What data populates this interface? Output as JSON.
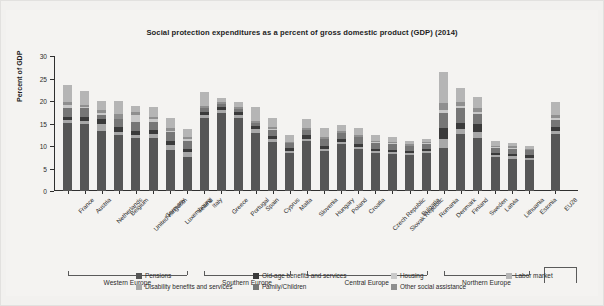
{
  "chart_data": {
    "type": "bar",
    "subtype": "stacked-bar",
    "title": "Social protection expenditures as a percent of gross domestic product (GDP) (2014)",
    "xlabel": "",
    "ylabel": "Percent of GDP",
    "ylim": [
      0,
      30
    ],
    "yticks": [
      0,
      5,
      10,
      15,
      20,
      25,
      30
    ],
    "grid": false,
    "legend_position": "bottom",
    "categories": [
      "France",
      "Austria",
      "Netherlands",
      "Belgium",
      "United Kingdom",
      "Germany",
      "Luxembourg",
      "Ireland",
      "Italy",
      "Greece",
      "Portugal",
      "Spain",
      "Cyprus",
      "Malta",
      "Slovenia",
      "Hungary",
      "Poland",
      "Croatia",
      "Czech Republic",
      "Slovak Republic",
      "Bulgaria",
      "Romania",
      "Denmark",
      "Finland",
      "Sweden",
      "Latvia",
      "Lithuania",
      "Estonia",
      "EU28"
    ],
    "series": [
      {
        "name": "Pensions",
        "color": "#565656",
        "values": [
          15.1,
          14.8,
          13.3,
          12.4,
          11.7,
          11.8,
          9.2,
          7.6,
          16.3,
          17.4,
          16.2,
          13.0,
          11.0,
          8.5,
          11.1,
          8.8,
          10.4,
          9.3,
          8.4,
          8.2,
          8.1,
          8.5,
          9.6,
          12.6,
          11.8,
          7.5,
          7.2,
          7.0,
          12.6
        ]
      },
      {
        "name": "Disability benefits and services",
        "color": "#a8a8a8",
        "values": [
          0.6,
          0.7,
          1.6,
          0.8,
          0.8,
          0.9,
          1.1,
          1.1,
          0.5,
          0.5,
          0.6,
          0.7,
          0.5,
          0.5,
          0.5,
          0.6,
          0.6,
          0.5,
          0.5,
          0.5,
          0.4,
          0.4,
          2.0,
          1.2,
          1.3,
          0.4,
          0.5,
          0.4,
          0.7
        ]
      },
      {
        "name": "Old-age benefits and services",
        "color": "#3a3a3a",
        "values": [
          0.8,
          1.0,
          1.2,
          1.0,
          0.9,
          0.9,
          0.9,
          0.6,
          0.8,
          0.8,
          0.7,
          0.7,
          0.7,
          0.6,
          0.8,
          0.6,
          0.5,
          0.6,
          0.5,
          0.5,
          0.4,
          0.4,
          2.3,
          1.4,
          1.9,
          0.5,
          0.5,
          0.5,
          0.9
        ]
      },
      {
        "name": "Family/Children",
        "color": "#767676",
        "values": [
          1.9,
          1.9,
          0.9,
          1.7,
          1.9,
          1.8,
          1.9,
          1.8,
          0.8,
          0.6,
          0.7,
          0.7,
          1.3,
          1.0,
          1.2,
          1.5,
          1.3,
          1.5,
          1.3,
          1.3,
          1.1,
          1.2,
          3.5,
          3.2,
          2.1,
          1.2,
          1.2,
          1.2,
          1.6
        ]
      },
      {
        "name": "Housing",
        "color": "#c9c9c9",
        "values": [
          0.8,
          0.2,
          0.4,
          0.2,
          1.5,
          0.5,
          0.3,
          0.5,
          0.1,
          0.1,
          0.1,
          0.1,
          0.2,
          0.1,
          0.0,
          0.1,
          0.1,
          0.1,
          0.1,
          0.1,
          0.1,
          0.1,
          0.7,
          0.4,
          0.4,
          0.1,
          0.1,
          0.0,
          0.5
        ]
      },
      {
        "name": "Other social assistance",
        "color": "#8f8f8f",
        "values": [
          0.7,
          0.6,
          0.6,
          1.1,
          0.7,
          0.5,
          0.6,
          0.5,
          0.3,
          0.3,
          0.3,
          0.4,
          0.5,
          0.3,
          0.4,
          0.5,
          0.5,
          0.5,
          0.4,
          0.4,
          0.3,
          0.3,
          1.4,
          1.1,
          0.9,
          0.4,
          0.4,
          0.3,
          0.6
        ]
      },
      {
        "name": "Labor market",
        "color": "#b5b5b5",
        "values": [
          3.6,
          3.0,
          2.0,
          2.8,
          1.4,
          2.2,
          2.2,
          1.6,
          3.2,
          1.0,
          1.1,
          3.0,
          2.0,
          1.5,
          2.1,
          2.0,
          1.2,
          1.6,
          1.2,
          1.0,
          0.8,
          0.6,
          7.0,
          3.0,
          2.6,
          1.0,
          0.8,
          0.7,
          3.0
        ]
      }
    ],
    "totals": [
      23.5,
      22.2,
      20.0,
      20.0,
      18.9,
      18.6,
      16.2,
      13.7,
      22.0,
      20.7,
      19.7,
      18.6,
      16.2,
      12.5,
      16.1,
      14.1,
      14.6,
      14.1,
      12.4,
      12.0,
      11.2,
      11.5,
      26.5,
      22.9,
      21.0,
      11.1,
      10.7,
      10.1,
      19.9
    ]
  },
  "groups": [
    {
      "label": "Western Europe",
      "start": 0,
      "end": 7
    },
    {
      "label": "Southern Europe",
      "start": 8,
      "end": 13
    },
    {
      "label": "Central Europe",
      "start": 14,
      "end": 21
    },
    {
      "label": "Northern Europe",
      "start": 22,
      "end": 27
    }
  ],
  "legend": {
    "items": [
      {
        "label": "Pensions",
        "color": "#565656"
      },
      {
        "label": "Old-age benefits and services",
        "color": "#3a3a3a"
      },
      {
        "label": "Housing",
        "color": "#c9c9c9"
      },
      {
        "label": "Labor market",
        "color": "#b5b5b5"
      },
      {
        "label": "Disability benefits and services",
        "color": "#a8a8a8"
      },
      {
        "label": "Family/Children",
        "color": "#767676"
      },
      {
        "label": "Other social assistance",
        "color": "#8f8f8f"
      }
    ]
  },
  "colors": {
    "background": "#f4f3f1",
    "axis": "#2f2f2f",
    "text": "#2b2b2b"
  }
}
